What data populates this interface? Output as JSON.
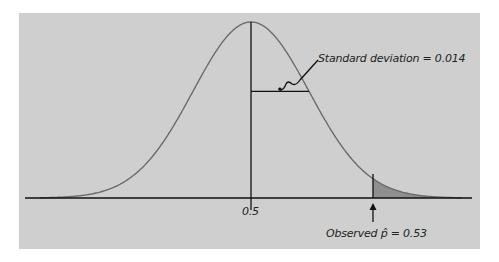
{
  "chart_data": {
    "type": "area",
    "title": "",
    "distribution": {
      "kind": "normal",
      "mean": 0.5,
      "sd": 0.014
    },
    "x_tick_labels": [
      "0.5"
    ],
    "annotations": [
      {
        "text": "Standard deviation = 0.014",
        "target": "horizontal segment from mean to one SD"
      },
      {
        "text": "Observed p̂ = 0.53",
        "target": "vertical line at 0.53 with shaded right tail"
      }
    ],
    "shaded_region": {
      "from": 0.53,
      "to": "right tail"
    },
    "xlabel": "",
    "ylabel": "",
    "grid": false,
    "legend": null
  },
  "labels": {
    "sd_label": "Standard deviation = 0.014",
    "center_tick": "0.5",
    "observed_prefix": "Observed ",
    "observed_phat": "p̂",
    "observed_suffix": " = 0.53"
  },
  "colors": {
    "panel": "#cfcfcf",
    "curve": "#6b6b6b",
    "shade": "#8f8f8f",
    "axis": "#111111"
  }
}
